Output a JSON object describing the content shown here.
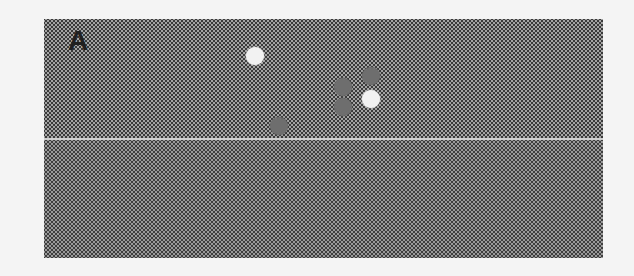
{
  "figure": {
    "panel_label": "A",
    "regions": [
      {
        "name": "upper",
        "fill": "#a4a4a4",
        "pattern": "dotted-light"
      },
      {
        "name": "lower",
        "fill": "#3e3e3e",
        "pattern": "dotted-dark"
      }
    ],
    "dots": [
      {
        "color": "white",
        "x": 255,
        "y": 56
      },
      {
        "color": "gray",
        "x": 343,
        "y": 87
      },
      {
        "color": "gray",
        "x": 371,
        "y": 76
      },
      {
        "color": "white",
        "x": 371,
        "y": 99
      },
      {
        "color": "gray",
        "x": 343,
        "y": 107
      },
      {
        "color": "gray",
        "x": 279,
        "y": 126
      }
    ]
  }
}
